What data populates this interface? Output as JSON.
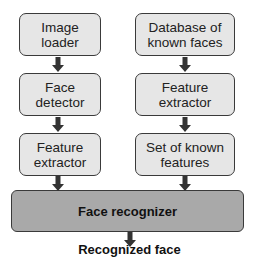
{
  "diagram": {
    "left_column": [
      {
        "id": "image-loader",
        "label": "Image loader",
        "lines": [
          "Image",
          "loader"
        ]
      },
      {
        "id": "face-detector",
        "label": "Face detector",
        "lines": [
          "Face",
          "detector"
        ]
      },
      {
        "id": "feature-extractor-left",
        "label": "Feature extractor",
        "lines": [
          "Feature",
          "extractor"
        ]
      }
    ],
    "right_column": [
      {
        "id": "database-known-faces",
        "label": "Database of known faces",
        "lines": [
          "Database of",
          "known faces"
        ]
      },
      {
        "id": "feature-extractor-right",
        "label": "Feature extractor",
        "lines": [
          "Feature",
          "extractor"
        ]
      },
      {
        "id": "set-known-features",
        "label": "Set of known features",
        "lines": [
          "Set of known",
          "features"
        ]
      }
    ],
    "merge_node": {
      "id": "face-recognizer",
      "label": "Face recognizer"
    },
    "output": {
      "label": "Recognized face"
    },
    "edges": [
      [
        "Image loader",
        "Face detector"
      ],
      [
        "Face detector",
        "Feature extractor"
      ],
      [
        "Feature extractor",
        "Face recognizer"
      ],
      [
        "Database of known faces",
        "Feature extractor"
      ],
      [
        "Feature extractor",
        "Set of known features"
      ],
      [
        "Set of known features",
        "Face recognizer"
      ],
      [
        "Face recognizer",
        "Recognized face"
      ]
    ],
    "colors": {
      "box_fill": "#e6e6e6",
      "merge_fill": "#a9a9a9",
      "stroke": "#3a3a3a",
      "arrow": "#333333"
    }
  }
}
